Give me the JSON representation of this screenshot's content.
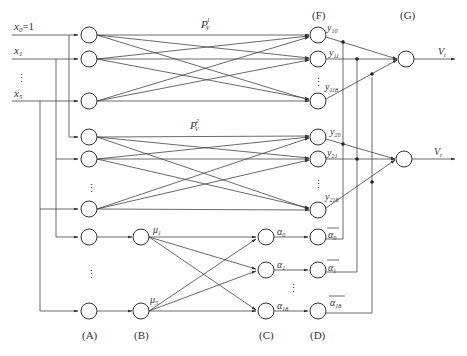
{
  "inputs": {
    "x0": {
      "base": "x",
      "sub": "0",
      "suffix": "=1"
    },
    "x1": {
      "base": "x",
      "sub": "1"
    },
    "x5": {
      "base": "x",
      "sub": "5"
    },
    "ellipsis": "⋮"
  },
  "layer_labels": {
    "A": "(A)",
    "B": "(B)",
    "C": "(C)",
    "D": "(D)",
    "F": "(F)",
    "G": "(G)"
  },
  "weights": {
    "p1": {
      "base": "P",
      "sup": "1",
      "sub": "V"
    },
    "p2": {
      "base": "P",
      "sup": "2",
      "sub": "V"
    }
  },
  "outputs_group1": {
    "y10": {
      "base": "y",
      "sub": "10"
    },
    "y11": {
      "base": "y",
      "sub": "11"
    },
    "y118": {
      "base": "y",
      "sub": "118"
    }
  },
  "outputs_group2": {
    "y20": {
      "base": "y",
      "sub": "20"
    },
    "y21": {
      "base": "y",
      "sub": "21"
    },
    "y218": {
      "base": "y",
      "sub": "218"
    }
  },
  "membership": {
    "mu1": {
      "base": "μ",
      "sub": "1"
    },
    "mu5": {
      "base": "μ",
      "sub": "5"
    }
  },
  "rules": {
    "a0": {
      "base": "α",
      "sub": "0"
    },
    "a1": {
      "base": "α",
      "sub": "1"
    },
    "a18": {
      "base": "α",
      "sub": "18"
    }
  },
  "normalized_rules": {
    "a0bar": {
      "base": "α",
      "sub": "0"
    },
    "a1bar": {
      "base": "α",
      "sub": "1"
    },
    "a18bar": {
      "base": "α",
      "sub": "18"
    }
  },
  "final_outputs": {
    "vt": {
      "base": "V",
      "sub": "t"
    },
    "vr": {
      "base": "V",
      "sub": "r"
    }
  }
}
